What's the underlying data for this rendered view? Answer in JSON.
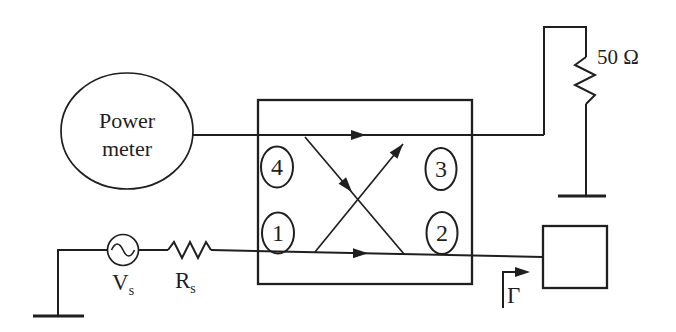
{
  "figure": {
    "type": "directional-coupler-reflection-measurement-schematic",
    "colors": {
      "background": "#ffffff",
      "ink": "#1f1f1f"
    },
    "power_meter": {
      "line1": "Power",
      "line2": "meter"
    },
    "coupler": {
      "port_top_left": "4",
      "port_bottom_left": "1",
      "port_top_right": "3",
      "port_bottom_right": "2"
    },
    "load": {
      "label": "50 Ω"
    },
    "source": {
      "base": "V",
      "sub": "s"
    },
    "source_resistor": {
      "base": "R",
      "sub": "s"
    },
    "reflection": {
      "label": "Γ"
    }
  }
}
